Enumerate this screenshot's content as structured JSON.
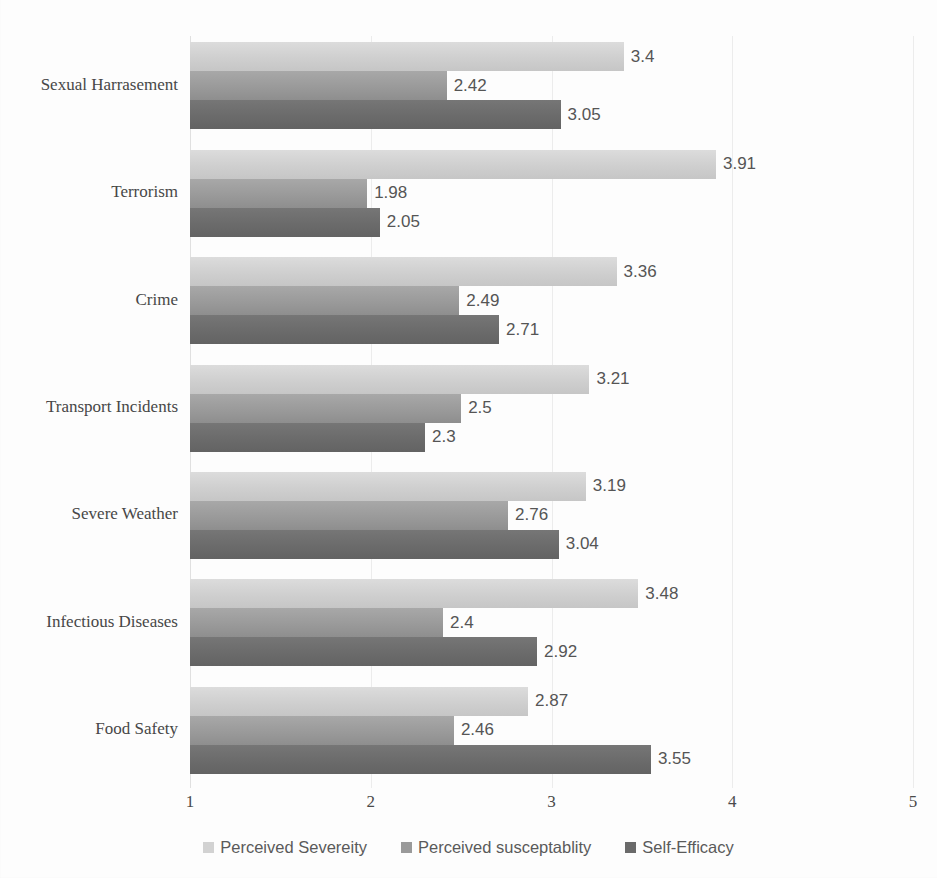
{
  "chart_data": {
    "type": "bar",
    "orientation": "horizontal",
    "title": "",
    "xlabel": "",
    "ylabel": "",
    "xlim": [
      1,
      5
    ],
    "xticks": [
      "1",
      "2",
      "3",
      "4",
      "5"
    ],
    "grid": true,
    "legend_position": "bottom",
    "categories": [
      "Sexual Harrasement",
      "Terrorism",
      "Crime",
      "Transport Incidents",
      "Severe Weather",
      "Infectious Diseases",
      "Food Safety"
    ],
    "series": [
      {
        "name": "Perceived Severeity",
        "color": "#d2d2d2",
        "values": [
          3.4,
          3.91,
          3.36,
          3.21,
          3.19,
          3.48,
          2.87
        ],
        "labels": [
          "3.4",
          "3.91",
          "3.36",
          "3.21",
          "3.19",
          "3.48",
          "2.87"
        ]
      },
      {
        "name": "Perceived susceptablity",
        "color": "#9a9a9a",
        "values": [
          2.42,
          1.98,
          2.49,
          2.5,
          2.76,
          2.4,
          2.46
        ],
        "labels": [
          "2.42",
          "1.98",
          "2.49",
          "2.5",
          "2.76",
          "2.4",
          "2.46"
        ]
      },
      {
        "name": "Self-Efficacy",
        "color": "#6a6a6a",
        "values": [
          3.05,
          2.05,
          2.71,
          2.3,
          3.04,
          2.92,
          3.55
        ],
        "labels": [
          "3.05",
          "2.05",
          "2.71",
          "2.3",
          "3.04",
          "2.92",
          "3.55"
        ]
      }
    ]
  },
  "legend": {
    "items": [
      {
        "label": "Perceived Severeity",
        "swatch": "sev"
      },
      {
        "label": "Perceived susceptablity",
        "swatch": "sus"
      },
      {
        "label": "Self-Efficacy",
        "swatch": "eff"
      }
    ]
  }
}
